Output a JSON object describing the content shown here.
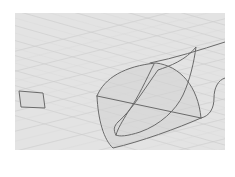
{
  "window": {
    "viewport_title": "",
    "view_type": "perspective"
  },
  "viewport": {
    "background_color": "#e3e3e3",
    "grid_color": "#cbcbcb",
    "grid_major_color": "#bdbdbd",
    "curve_color": "#6a6a6a",
    "frame": {
      "x": 15,
      "y": 13,
      "width": 210,
      "height": 137
    }
  },
  "objects": [
    {
      "name": "rectangle",
      "type": "planar-quad",
      "points": [
        [
          19,
          91
        ],
        [
          43,
          93
        ],
        [
          45,
          108
        ],
        [
          21,
          107
        ]
      ]
    },
    {
      "name": "surface-outer-loop",
      "type": "freeform-curve"
    },
    {
      "name": "surface-inner-loop",
      "type": "freeform-curve"
    },
    {
      "name": "cross-curve",
      "type": "line"
    },
    {
      "name": "profile-curve",
      "type": "freeform-curve"
    },
    {
      "name": "edge-curve-right",
      "type": "freeform-curve"
    }
  ]
}
